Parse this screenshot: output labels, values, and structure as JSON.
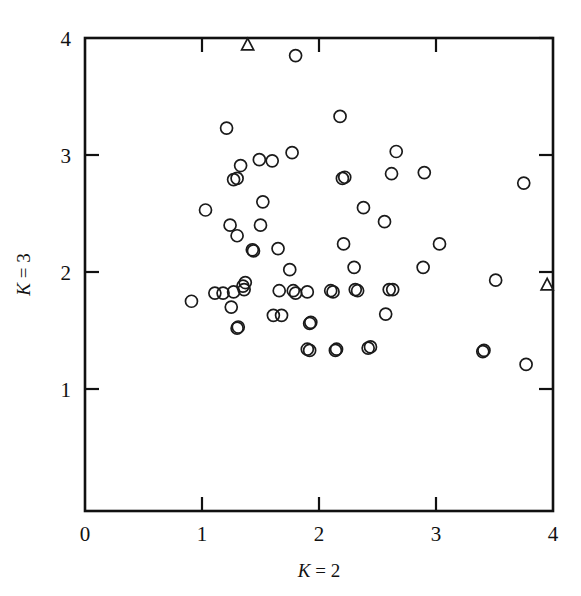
{
  "figure": {
    "background_color": "#ffffff",
    "ink_color": "#111111"
  },
  "chart_data": {
    "type": "scatter",
    "title": "",
    "subtitle": "",
    "xlabel": "K = 2",
    "ylabel": "K = 3",
    "xlabel_parts": {
      "symbol": "K",
      "relation": "=",
      "value": "2"
    },
    "ylabel_parts": {
      "symbol": "K",
      "relation": "=",
      "value": "3"
    },
    "xlim": [
      0,
      4
    ],
    "ylim": [
      0,
      4
    ],
    "xticks": [
      0,
      1,
      2,
      3,
      4
    ],
    "yticks": [
      1,
      2,
      3,
      4
    ],
    "xtick_labels": [
      "0",
      "1",
      "2",
      "3",
      "4"
    ],
    "ytick_labels": [
      "1",
      "2",
      "3",
      "4"
    ],
    "y_axis_origin_unlabeled": true,
    "grid": false,
    "legend": null,
    "mirror_ticks": true,
    "series": [
      {
        "name": "circles",
        "marker": "open-circle",
        "marker_radius_px": 6,
        "count": 65,
        "points": [
          [
            1.8,
            3.85
          ],
          [
            2.18,
            3.33
          ],
          [
            1.21,
            3.23
          ],
          [
            2.66,
            3.03
          ],
          [
            1.77,
            3.02
          ],
          [
            1.6,
            2.95
          ],
          [
            1.33,
            2.91
          ],
          [
            2.9,
            2.85
          ],
          [
            2.62,
            2.84
          ],
          [
            1.3,
            2.8
          ],
          [
            1.27,
            2.79
          ],
          [
            2.22,
            2.81
          ],
          [
            3.75,
            2.76
          ],
          [
            1.52,
            2.6
          ],
          [
            2.38,
            2.55
          ],
          [
            1.03,
            2.53
          ],
          [
            2.56,
            2.43
          ],
          [
            1.5,
            2.4
          ],
          [
            1.24,
            2.4
          ],
          [
            1.3,
            2.31
          ],
          [
            3.03,
            2.24
          ],
          [
            2.21,
            2.24
          ],
          [
            1.65,
            2.2
          ],
          [
            1.43,
            2.19
          ],
          [
            2.89,
            2.04
          ],
          [
            2.3,
            2.04
          ],
          [
            1.75,
            2.02
          ],
          [
            3.51,
            1.93
          ],
          [
            1.37,
            1.91
          ],
          [
            1.36,
            1.85
          ],
          [
            2.6,
            1.85
          ],
          [
            2.31,
            1.85
          ],
          [
            2.1,
            1.84
          ],
          [
            1.9,
            1.83
          ],
          [
            1.78,
            1.84
          ],
          [
            1.66,
            1.84
          ],
          [
            1.27,
            1.83
          ],
          [
            1.18,
            1.82
          ],
          [
            1.11,
            1.82
          ],
          [
            0.91,
            1.75
          ],
          [
            1.25,
            1.7
          ],
          [
            2.57,
            1.64
          ],
          [
            1.61,
            1.63
          ],
          [
            1.93,
            1.57
          ],
          [
            1.31,
            1.53
          ],
          [
            2.44,
            1.36
          ],
          [
            2.15,
            1.34
          ],
          [
            1.92,
            1.33
          ],
          [
            3.41,
            1.33
          ],
          [
            3.77,
            1.21
          ],
          [
            1.49,
            2.96
          ],
          [
            2.2,
            2.8
          ],
          [
            1.44,
            2.18
          ],
          [
            1.35,
            1.88
          ],
          [
            2.63,
            1.85
          ],
          [
            1.8,
            1.82
          ],
          [
            2.12,
            1.83
          ],
          [
            2.33,
            1.84
          ],
          [
            1.68,
            1.63
          ],
          [
            1.3,
            1.52
          ],
          [
            1.92,
            1.56
          ],
          [
            2.42,
            1.35
          ],
          [
            2.14,
            1.33
          ],
          [
            1.9,
            1.34
          ],
          [
            3.4,
            1.32
          ]
        ]
      },
      {
        "name": "triangles",
        "marker": "open-triangle",
        "marker_size_px": 11,
        "count": 2,
        "points": [
          [
            1.39,
            3.94
          ],
          [
            3.95,
            1.89
          ]
        ]
      }
    ]
  }
}
